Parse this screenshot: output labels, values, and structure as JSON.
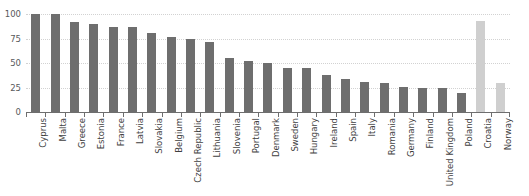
{
  "chart_data": {
    "type": "bar",
    "title": "",
    "subtitle": "",
    "xlabel": "",
    "ylabel": "",
    "ylim": [
      0,
      100
    ],
    "yticks": [
      0,
      25,
      50,
      75,
      100
    ],
    "ytick_labels": [
      "0",
      "25",
      "50",
      "75",
      "100"
    ],
    "grid": "horizontal-dotted",
    "legend": "none",
    "orientation": "vertical",
    "sorted": "descending (EU group), with Croatia and Norway appended",
    "categories": [
      "Cyprus",
      "Malta",
      "Greece",
      "Estonia",
      "France",
      "Latvia",
      "Slovakia",
      "Belgium",
      "Czech Republic",
      "Lithuania",
      "Slovenia",
      "Portugal",
      "Denmark",
      "Sweden",
      "Hungary",
      "Ireland",
      "Spain",
      "Italy",
      "Romania",
      "Germany",
      "Finland",
      "United Kingdom",
      "Poland",
      "Croatia",
      "Norway"
    ],
    "values": [
      100,
      100,
      92,
      90,
      87,
      87,
      81,
      77,
      74,
      71,
      55,
      52,
      50,
      45,
      45,
      38,
      34,
      31,
      30,
      26,
      24,
      24,
      19,
      93,
      30
    ],
    "bar_colors": [
      "#6e6e6e",
      "#6e6e6e",
      "#6e6e6e",
      "#6e6e6e",
      "#6e6e6e",
      "#6e6e6e",
      "#6e6e6e",
      "#6e6e6e",
      "#6e6e6e",
      "#6e6e6e",
      "#6e6e6e",
      "#6e6e6e",
      "#6e6e6e",
      "#6e6e6e",
      "#6e6e6e",
      "#6e6e6e",
      "#6e6e6e",
      "#6e6e6e",
      "#6e6e6e",
      "#6e6e6e",
      "#6e6e6e",
      "#6e6e6e",
      "#6e6e6e",
      "#cfcfcf",
      "#cfcfcf"
    ]
  },
  "colors": {
    "bar_primary": "#6e6e6e",
    "bar_secondary": "#cfcfcf",
    "gridline": "#d2d2d2",
    "axis": "#6e6e6e",
    "tick_label": "#58595b",
    "category_label": "#3f3f3f",
    "background": "#ffffff"
  }
}
